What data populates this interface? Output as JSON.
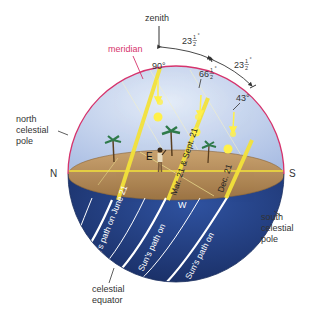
{
  "diagram": {
    "type": "celestial-sphere-sun-paths",
    "labels": {
      "zenith": "zenith",
      "meridian": "meridian",
      "north_celestial_pole": [
        "north",
        "celestial",
        "pole"
      ],
      "south_celestial_pole": [
        "south",
        "celestial",
        "pole"
      ],
      "celestial_equator": [
        "celestial",
        "equator"
      ],
      "north": "N",
      "south": "S",
      "east": "E",
      "west": "W"
    },
    "angles": {
      "noon_equinox": "90°",
      "noon_june": "66",
      "noon_dec": "43°",
      "tilt_1": "23",
      "tilt_2": "23",
      "frac_num": "1",
      "frac_den": "2",
      "degree": "°"
    },
    "sun_paths": {
      "june": "Sun's path on June 21",
      "equinox_a": "Sun's path on",
      "equinox_b": "Mar. 21 & Sept. 21",
      "december_a": "Sun's path on",
      "december_b": "Dec. 21"
    },
    "colors": {
      "sky": "#c9d6ee",
      "ground": "#b88e5c",
      "below_horizon": "#1f3a78",
      "meridian": "#d6336c",
      "sun_path": "#f3e23a",
      "sun": "#fff04a"
    }
  }
}
